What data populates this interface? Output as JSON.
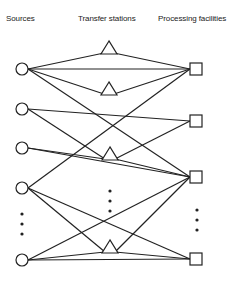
{
  "headers": {
    "sources": "Sources",
    "transfer_stations": "Transfer stations",
    "processing_facilities": "Processing facilities"
  },
  "colors": {
    "stroke": "#222222",
    "background": "#ffffff"
  },
  "nodes": {
    "sources": [
      "S1",
      "S2",
      "S3",
      "S4",
      "S5"
    ],
    "transfer_stations": [
      "T1",
      "T2",
      "T3",
      "T4"
    ],
    "processing_facilities": [
      "F1",
      "F2",
      "F3",
      "F4"
    ]
  },
  "edges": [
    [
      "S1",
      "T1"
    ],
    [
      "S1",
      "T2"
    ],
    [
      "S1",
      "F1"
    ],
    [
      "S1",
      "F3"
    ],
    [
      "T1",
      "F1"
    ],
    [
      "T2",
      "F1"
    ],
    [
      "S2",
      "F2"
    ],
    [
      "S2",
      "T3"
    ],
    [
      "S3",
      "T3"
    ],
    [
      "S3",
      "F3"
    ],
    [
      "T3",
      "F2"
    ],
    [
      "T3",
      "F3"
    ],
    [
      "S4",
      "F1"
    ],
    [
      "S4",
      "T4"
    ],
    [
      "S4",
      "F4"
    ],
    [
      "S5",
      "T4"
    ],
    [
      "S5",
      "F4"
    ],
    [
      "S5",
      "F3"
    ],
    [
      "T4",
      "F3"
    ],
    [
      "T4",
      "F4"
    ]
  ],
  "ellipsis_markers": [
    "sources-ellipsis",
    "transfer-ellipsis",
    "processing-ellipsis"
  ]
}
